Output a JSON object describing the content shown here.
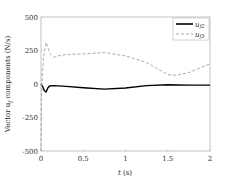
{
  "chart_data": {
    "type": "line",
    "title": "",
    "xlabel": "t (s)",
    "ylabel": "Vector u_f components (N/s)",
    "xlim": [
      0,
      2
    ],
    "ylim": [
      -500,
      500
    ],
    "xticks": [
      "0",
      "0.5",
      "1",
      "1.5",
      "2"
    ],
    "yticks": [
      "500",
      "250",
      "0",
      "-250",
      "-500"
    ],
    "grid": false,
    "legend_position": "upper right",
    "series": [
      {
        "name": "u_f2",
        "style": "solid",
        "color": "#000000",
        "x": [
          0,
          0.02,
          0.04,
          0.06,
          0.08,
          0.1,
          0.15,
          0.2,
          0.3,
          0.5,
          0.75,
          1.0,
          1.25,
          1.5,
          1.75,
          2.0
        ],
        "y": [
          0,
          -20,
          -50,
          -60,
          -30,
          -15,
          -12,
          -14,
          -18,
          -28,
          -38,
          -30,
          -12,
          -5,
          -8,
          -8
        ]
      },
      {
        "name": "u_f3",
        "style": "dashed",
        "color": "#aaaaaa",
        "x": [
          0,
          0.01,
          0.03,
          0.06,
          0.08,
          0.1,
          0.15,
          0.2,
          0.3,
          0.5,
          0.75,
          1.0,
          1.25,
          1.5,
          1.6,
          1.75,
          2.0
        ],
        "y": [
          -500,
          0,
          200,
          310,
          280,
          230,
          200,
          210,
          220,
          225,
          235,
          210,
          160,
          70,
          65,
          85,
          150
        ]
      }
    ]
  },
  "legend": {
    "items": [
      {
        "label": "u",
        "sub": "f2"
      },
      {
        "label": "u",
        "sub": "f3"
      }
    ]
  },
  "axes": {
    "xlabel_t": "t",
    "xlabel_unit": " (s)",
    "ylabel_pre": "Vector u",
    "ylabel_sub": "f",
    "ylabel_post": " components (N/s)"
  }
}
